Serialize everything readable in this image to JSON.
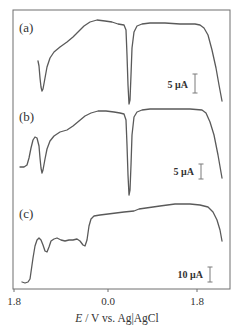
{
  "chart_data": {
    "type": "line",
    "title": "",
    "xlabel": "E / V vs. Ag|AgCl",
    "xlabel_italic_part": "E",
    "xlabel_rest": " / V vs. Ag|AgCl",
    "ylabel": "",
    "x_ticks": [
      {
        "label": "1.8",
        "x_px": 14,
        "value": -1.8
      },
      {
        "label": "0.0",
        "x_px": 108,
        "value": 0.0
      },
      {
        "label": "1.8",
        "x_px": 197,
        "value": 1.8
      }
    ],
    "xlim": [
      -1.8,
      2.1
    ],
    "grid": false,
    "legend": "none",
    "frame": {
      "left": 13,
      "top": 10,
      "right": 230,
      "bottom": 289
    },
    "series": [
      {
        "name": "(a)",
        "label": "(a)",
        "label_pos": [
          19,
          32
        ],
        "scale_bar": {
          "label": "5 μA",
          "x": 195,
          "y1": 74,
          "y2": 93,
          "label_x": 188,
          "label_y": 88
        },
        "points_px": [
          [
            38,
            61
          ],
          [
            39,
            66
          ],
          [
            40,
            78
          ],
          [
            41,
            87
          ],
          [
            42,
            91
          ],
          [
            43,
            89
          ],
          [
            45,
            78
          ],
          [
            47,
            67
          ],
          [
            50,
            58
          ],
          [
            54,
            52
          ],
          [
            60,
            47
          ],
          [
            67,
            42
          ],
          [
            73,
            37
          ],
          [
            78,
            32
          ],
          [
            84,
            26
          ],
          [
            90,
            22
          ],
          [
            97,
            20
          ],
          [
            105,
            21
          ],
          [
            112,
            22
          ],
          [
            118,
            24
          ],
          [
            124,
            25
          ],
          [
            126,
            30
          ],
          [
            127,
            55
          ],
          [
            128,
            85
          ],
          [
            129,
            104
          ],
          [
            130,
            100
          ],
          [
            131,
            75
          ],
          [
            132,
            48
          ],
          [
            134,
            32
          ],
          [
            137,
            26
          ],
          [
            142,
            24
          ],
          [
            150,
            23
          ],
          [
            165,
            23
          ],
          [
            180,
            24
          ],
          [
            195,
            24
          ],
          [
            200,
            25
          ],
          [
            204,
            28
          ],
          [
            208,
            35
          ],
          [
            212,
            50
          ],
          [
            216,
            68
          ],
          [
            219,
            85
          ],
          [
            222,
            101
          ]
        ]
      },
      {
        "name": "(b)",
        "label": "(b)",
        "label_pos": [
          19,
          121
        ],
        "scale_bar": {
          "label": "5 μA",
          "x": 201,
          "y1": 164,
          "y2": 179,
          "label_x": 194,
          "label_y": 175
        },
        "points_px": [
          [
            20,
            167
          ],
          [
            24,
            167
          ],
          [
            27,
            165
          ],
          [
            29,
            158
          ],
          [
            31,
            148
          ],
          [
            33,
            140
          ],
          [
            35,
            137
          ],
          [
            37,
            138
          ],
          [
            39,
            146
          ],
          [
            40,
            158
          ],
          [
            41,
            168
          ],
          [
            42,
            173
          ],
          [
            43,
            170
          ],
          [
            45,
            159
          ],
          [
            47,
            149
          ],
          [
            50,
            141
          ],
          [
            54,
            136
          ],
          [
            60,
            132
          ],
          [
            67,
            130
          ],
          [
            73,
            126
          ],
          [
            79,
            121
          ],
          [
            85,
            116
          ],
          [
            91,
            113
          ],
          [
            98,
            111
          ],
          [
            106,
            111
          ],
          [
            114,
            112
          ],
          [
            120,
            113
          ],
          [
            124,
            114
          ],
          [
            126,
            120
          ],
          [
            127,
            145
          ],
          [
            128,
            175
          ],
          [
            129,
            195
          ],
          [
            130,
            190
          ],
          [
            131,
            165
          ],
          [
            132,
            135
          ],
          [
            134,
            117
          ],
          [
            137,
            112
          ],
          [
            142,
            110
          ],
          [
            150,
            109
          ],
          [
            170,
            109
          ],
          [
            190,
            109
          ],
          [
            202,
            110
          ],
          [
            206,
            113
          ],
          [
            210,
            122
          ],
          [
            214,
            135
          ],
          [
            218,
            155
          ],
          [
            222,
            178
          ]
        ]
      },
      {
        "name": "(c)",
        "label": "(c)",
        "label_pos": [
          19,
          218
        ],
        "scale_bar": {
          "label": "10 μA",
          "x": 210,
          "y1": 267,
          "y2": 282,
          "label_x": 203,
          "label_y": 278
        },
        "points_px": [
          [
            22,
            282
          ],
          [
            25,
            283
          ],
          [
            28,
            282
          ],
          [
            30,
            279
          ],
          [
            31,
            272
          ],
          [
            33,
            258
          ],
          [
            35,
            246
          ],
          [
            37,
            240
          ],
          [
            39,
            238
          ],
          [
            41,
            240
          ],
          [
            43,
            245
          ],
          [
            45,
            251
          ],
          [
            47,
            252
          ],
          [
            49,
            247
          ],
          [
            51,
            241
          ],
          [
            54,
            239
          ],
          [
            57,
            238
          ],
          [
            61,
            240
          ],
          [
            65,
            241
          ],
          [
            69,
            240
          ],
          [
            73,
            240
          ],
          [
            77,
            239
          ],
          [
            80,
            241
          ],
          [
            83,
            245
          ],
          [
            85,
            246
          ],
          [
            87,
            240
          ],
          [
            89,
            226
          ],
          [
            91,
            219
          ],
          [
            94,
            216
          ],
          [
            100,
            215
          ],
          [
            108,
            214
          ],
          [
            116,
            213
          ],
          [
            124,
            212
          ],
          [
            134,
            211
          ],
          [
            139,
            209
          ],
          [
            146,
            208
          ],
          [
            160,
            206
          ],
          [
            175,
            204
          ],
          [
            190,
            204
          ],
          [
            200,
            205
          ],
          [
            208,
            207
          ],
          [
            213,
            212
          ],
          [
            217,
            220
          ],
          [
            220,
            230
          ],
          [
            222,
            241
          ]
        ]
      }
    ]
  }
}
